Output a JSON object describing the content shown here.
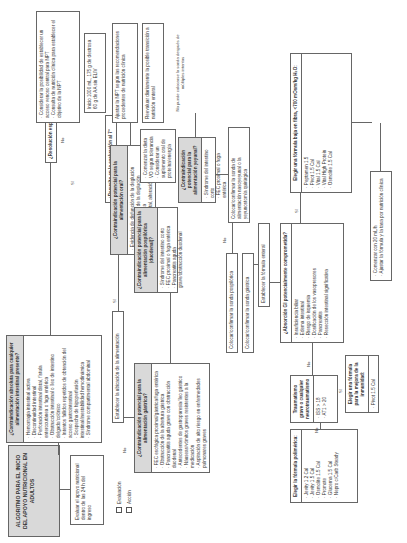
{
  "title": "ALGORITMO PARA EL INICIO DEL APOYO NUTRICIONAL EN ADULTOS",
  "legend": [
    {
      "label": "Evaluación"
    },
    {
      "label": "Acción"
    }
  ],
  "start_action": "Evaluar el apoyo nutricional dentro de las 24 h del ingreso",
  "absolute_contra": {
    "question": "¿Contraindicación absoluta para cualquier alimentación intestinal presente?",
    "items": [
      "Hemorragia intestinal activa",
      "Discontinuidad intestinal",
      "Perforación intestinal distal, fístula enterocutánea o fuga entérica",
      "Obstrucción intestinal o íleo de intestino delgado/colónico",
      "Intentos fallidos repetidos de obtención del acceso gastrointestinal",
      "Sospecha de hipoperfusión intestinal/inestabilidad hemodinámica",
      "Síndrome compartimental abdominal"
    ]
  },
  "resolution_q": "¿Resolución esperada ≤ 7 días?",
  "resolved_7_q": "¿Resuelto en la evaluación al 7° día?",
  "npt_box": {
    "items": [
      "Considerar la posibilidad de establecer un acceso venoso central para NPT",
      "Consulta de nutrición clínica para establecer el objetivo de la NPT"
    ]
  },
  "npt_start": "Inicio 1000 mL, 175 g de dextrosa 60 g de AA sin ELIV",
  "npt_adjust": "Ajustar la NPT según las recomendaciones procedentes de nutrición clínica",
  "npt_reeval": "Reevaluar diariamente la posible transición a nutrición enteral",
  "oral_contra": {
    "question": "¿Contraindicación potencial para la alimentación oral?",
    "items": [
      "Evidencia de disfunción de la deglución",
      "Evaluación del fallo de la deglución",
      "Ventilación mecánica",
      "Poca actividad mental, alteración del estado mental"
    ]
  },
  "oral_diet": {
    "items": [
      "Comenzar la dieta VO según tolerancia",
      "Considerar un suplemento oral de proteína/energía"
    ]
  },
  "jejunal_contra": {
    "question": "¿Contraindicación potencial para la alimentación yeyunal?",
    "items": [
      "Síndrome del intestino corto",
      "FEC proximal o fuga entérica"
    ]
  },
  "no_sonda_note": "No puede colocarse la sonda después de múltiples intentos",
  "place_nj": "Colocar/confirmar la sonda de alimentación nasoyeyunal o la yeyunostomía quirúrgica",
  "postpyloric_contra": {
    "question": "¿Contraindicación potencial para la alimentación pospilórica (duodenal)?",
    "items": [
      "Síndrome del intestino corto",
      "FEC proximal o fuga entérica",
      "Pancreatitis aguda grave/obstrucción duodenal"
    ]
  },
  "establish_location": "Establecer la ubicación de la alimentación",
  "gastric_contra": {
    "question": "¿Contraindicación potencial para la alimentación gástrica?",
    "items": [
      "FEC esofágica proximal/gástrica/fuga entérica",
      "Obstrucción de la abertura gástrica",
      "Pancreatitis aguda grave con obstrucción duodenal",
      "Antecedentes de gastroparesia/íleo gástrico",
      "Náuseas/vómitos graves resistentes a la medicación",
      "Aspiración de alto riesgo en enfermedades pulmonares graves"
    ]
  },
  "place_postpyloric": "Colocar/confirmar la sonda pospilórica",
  "place_gastric": "Colocar/confirmar la sonda gástrica",
  "establish_formula": "Establecer la fórmula enteral",
  "gi_absorption": {
    "question": "¿Absorción GI potencialmente comprometida?",
    "items": [
      "Insuficiencia biliar",
      "Edema intestinal",
      "Riesgo de isquemia",
      "Dosificación de los vasopresores",
      "Pancreatitis",
      "Resección intestinal significativa"
    ]
  },
  "low_fiber": {
    "question": "Elegir una fórmula baja en fibra, <700 mOsm/kg H₂O:",
    "items": [
      "Peptamen 1.5",
      "Pivot 1.5 Cal",
      "Vital 1.5 Cal",
      "Vital High Protein",
      "Osmolite 1.5 Cal"
    ]
  },
  "trauma": {
    "question": "Traumatismo grave o cualquier neurotraumatismo",
    "items": [
      "ISS > 18",
      "AT1 > 20"
    ]
  },
  "immunity": {
    "question": "Elegir una fórmula para la mejora de la inmunidad:",
    "items": [
      "Pivot 1.5 Cal"
    ]
  },
  "polymeric": {
    "question": "Elegir la fórmula polimérica:",
    "items": [
      "Jevity 1.2 Cal",
      "Jevity 1.5 Cal",
      "Osmolite 1.5 Cal",
      "Promote",
      "Glucerna 1.5 Cal",
      "Nepro c/Carb Steady"
    ]
  },
  "final": {
    "items": [
      "Comenzar con 20 mL/h",
      "Ajustar la fórmula y la tasa por nutrición clínica"
    ]
  },
  "labels": {
    "si": "Sí",
    "no": "No"
  }
}
